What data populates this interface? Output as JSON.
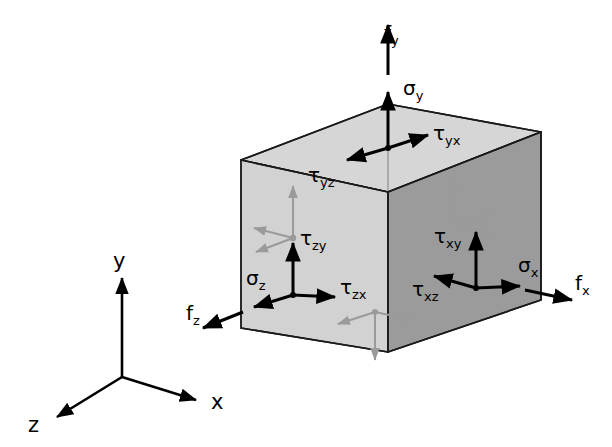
{
  "figure": {
    "type": "diagram",
    "title": "",
    "background_color": "#ffffff",
    "stroke_color": "#1a1a1a",
    "ghost_color": "#9a9a9a"
  },
  "cube": {
    "faces": [
      {
        "id": "top",
        "name": "top-face",
        "normal": "y",
        "fill": "#d6d6d6"
      },
      {
        "id": "left",
        "name": "left-face",
        "normal": "z",
        "fill": "#d2d2d2"
      },
      {
        "id": "right",
        "name": "right-face",
        "normal": "x",
        "fill": "#9b9b9b"
      }
    ]
  },
  "axes": {
    "origin_label": "",
    "items": [
      {
        "id": "y",
        "label": "y",
        "direction": "up"
      },
      {
        "id": "z",
        "label": "z",
        "direction": "down-left"
      },
      {
        "id": "x",
        "label": "x",
        "direction": "down-right"
      }
    ]
  },
  "stresses": {
    "top_face": {
      "face_name": "y-face",
      "normal_stress": {
        "symbol": "σ",
        "sub": "y",
        "label": "σy",
        "direction": "up"
      },
      "shear_stresses": [
        {
          "symbol": "τ",
          "sub": "yz",
          "label": "τyz",
          "direction": "left"
        },
        {
          "symbol": "τ",
          "sub": "yx",
          "label": "τyx",
          "direction": "right"
        }
      ],
      "traction": {
        "symbol": "f",
        "sub": "y",
        "label": "fy",
        "direction": "up"
      }
    },
    "left_face": {
      "face_name": "z-face",
      "normal_stress": {
        "symbol": "σ",
        "sub": "z",
        "label": "σz",
        "direction": "left"
      },
      "shear_stresses": [
        {
          "symbol": "τ",
          "sub": "zy",
          "label": "τzy",
          "direction": "up"
        },
        {
          "symbol": "τ",
          "sub": "zx",
          "label": "τzx",
          "direction": "right"
        }
      ],
      "traction": {
        "symbol": "f",
        "sub": "z",
        "label": "fz",
        "direction": "down-left"
      }
    },
    "right_face": {
      "face_name": "x-face",
      "normal_stress": {
        "symbol": "σ",
        "sub": "x",
        "label": "σx",
        "direction": "right"
      },
      "shear_stresses": [
        {
          "symbol": "τ",
          "sub": "xy",
          "label": "τxy",
          "direction": "up"
        },
        {
          "symbol": "τ",
          "sub": "xz",
          "label": "τxz",
          "direction": "left"
        }
      ],
      "traction": {
        "symbol": "f",
        "sub": "x",
        "label": "fx",
        "direction": "down-right"
      }
    }
  },
  "labels": {
    "f_y": {
      "base": "f",
      "sub": "y"
    },
    "sig_y": {
      "base": "σ",
      "sub": "y"
    },
    "tau_yz": {
      "base": "τ",
      "sub": "yz"
    },
    "tau_yx": {
      "base": "τ",
      "sub": "yx"
    },
    "tau_zy": {
      "base": "τ",
      "sub": "zy"
    },
    "tau_zx": {
      "base": "τ",
      "sub": "zx"
    },
    "sig_z": {
      "base": "σ",
      "sub": "z"
    },
    "f_z": {
      "base": "f",
      "sub": "z"
    },
    "tau_xy": {
      "base": "τ",
      "sub": "xy"
    },
    "tau_xz": {
      "base": "τ",
      "sub": "xz"
    },
    "sig_x": {
      "base": "σ",
      "sub": "x"
    },
    "f_x": {
      "base": "f",
      "sub": "x"
    },
    "axis_y": {
      "base": "y",
      "sub": ""
    },
    "axis_x": {
      "base": "x",
      "sub": ""
    },
    "axis_z": {
      "base": "z",
      "sub": ""
    }
  }
}
